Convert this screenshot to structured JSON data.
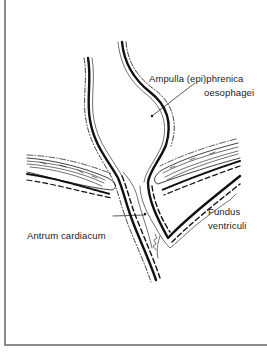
{
  "diagram": {
    "labels": {
      "ampulla_line1": "Ampulla  (epi)phrenica",
      "ampulla_line2": "oesophagei",
      "fundus_line1": "Fundus",
      "fundus_line2": "ventriculi",
      "antrum": "Antrum cardiacum"
    },
    "colors": {
      "ink": "#111111",
      "frame": "#8a8a8a",
      "background": "#ffffff"
    }
  }
}
